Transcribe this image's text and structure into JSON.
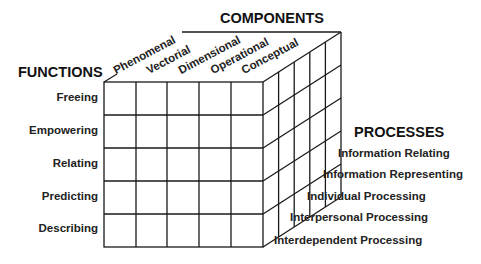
{
  "diagram": {
    "titles": {
      "functions": "FUNCTIONS",
      "components": "COMPONENTS",
      "processes": "PROCESSES"
    },
    "components": [
      "Phenomenal",
      "Vectorial",
      "Dimensional",
      "Operational",
      "Conceptual"
    ],
    "functions": [
      "Freeing",
      "Empowering",
      "Relating",
      "Predicting",
      "Describing"
    ],
    "processes": [
      "Information Relating",
      "Information Representing",
      "Individual Processing",
      "Interpersonal Processing",
      "Interdependent Processing"
    ],
    "colors": {
      "line": "#1a1a1a",
      "text": "#222222",
      "background": "#ffffff"
    }
  }
}
